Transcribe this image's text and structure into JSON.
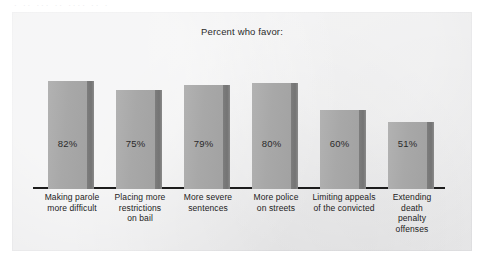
{
  "scan": {
    "artifact_text": "· ·· ··· ·· ···· ·· ·"
  },
  "colors": {
    "panel_background": "#ececed",
    "bar_face": "#a8a8a8",
    "bar_edge": "#7d7d7d",
    "axis": "#1c1c1c",
    "text": "#222222"
  },
  "chart_data": {
    "type": "bar",
    "title": "Percent who favor:",
    "xlabel": "",
    "ylabel": "",
    "ylim": [
      0,
      100
    ],
    "grid": false,
    "legend": "none",
    "orientation": "vertical",
    "categories": [
      "Making parole more difficult",
      "Placing more restrictions on bail",
      "More severe sentences",
      "More police on streets",
      "Limiting appeals of the convicted",
      "Extending death penalty offenses"
    ],
    "category_lines": [
      [
        "Making parole",
        "more difficult"
      ],
      [
        "Placing more",
        "restrictions",
        "on bail"
      ],
      [
        "More severe",
        "sentences"
      ],
      [
        "More police",
        "on streets"
      ],
      [
        "Limiting appeals",
        "of the convicted"
      ],
      [
        "Extending",
        "death",
        "penalty",
        "offenses"
      ]
    ],
    "values": [
      82,
      75,
      79,
      80,
      60,
      51
    ],
    "value_labels": [
      "82%",
      "75%",
      "79%",
      "80%",
      "60%",
      "51%"
    ]
  }
}
